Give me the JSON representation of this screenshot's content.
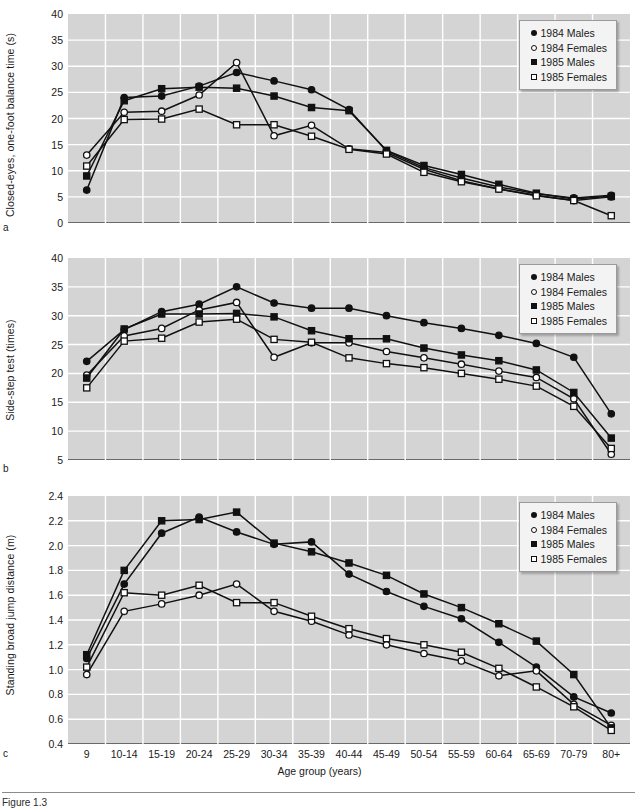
{
  "figure": {
    "caption_partial": "Figure 1.3",
    "x_axis_title": "Age group (years)",
    "categories": [
      "9",
      "10-14",
      "15-19",
      "20-24",
      "25-29",
      "30-34",
      "35-39",
      "40-44",
      "45-49",
      "50-54",
      "55-59",
      "60-64",
      "65-69",
      "70-79",
      "80+"
    ],
    "legend": [
      {
        "label": "1984 Males",
        "marker": "filled-circle"
      },
      {
        "label": "1984 Females",
        "marker": "open-circle"
      },
      {
        "label": "1985 Males",
        "marker": "filled-square"
      },
      {
        "label": "1985 Females",
        "marker": "open-square"
      }
    ],
    "colors": {
      "plot_background": "#d4d4d4",
      "gridline": "#ffffff",
      "series_line": "#111111",
      "axis": "#6a6a6a"
    }
  },
  "panels": [
    {
      "letter": "a",
      "ylabel": "Closed-eyes, one-foot balance time (s)"
    },
    {
      "letter": "b",
      "ylabel": "Side-step test (times)"
    },
    {
      "letter": "c",
      "ylabel": "Standing broad jump distance (m)"
    }
  ],
  "chart_data": [
    {
      "type": "line",
      "panel": "a",
      "title": "",
      "xlabel": "Age group (years)",
      "ylabel": "Closed-eyes, one-foot balance time (s)",
      "categories": [
        "9",
        "10-14",
        "15-19",
        "20-24",
        "25-29",
        "30-34",
        "35-39",
        "40-44",
        "45-49",
        "50-54",
        "55-59",
        "60-64",
        "65-69",
        "70-79",
        "80+"
      ],
      "yticks": [
        0,
        5,
        10,
        15,
        20,
        25,
        30,
        35,
        40
      ],
      "ylim": [
        0,
        40
      ],
      "grid": true,
      "legend_position": "top-right",
      "series": [
        {
          "name": "1984 Males",
          "marker": "filled-circle",
          "values": [
            6.3,
            24.0,
            24.3,
            26.2,
            28.8,
            27.2,
            25.5,
            21.7,
            13.8,
            10.6,
            8.6,
            6.9,
            5.6,
            4.8,
            5.3
          ]
        },
        {
          "name": "1984 Females",
          "marker": "open-circle",
          "values": [
            13.0,
            21.2,
            21.4,
            24.5,
            30.7,
            16.7,
            18.7,
            14.2,
            13.5,
            10.3,
            8.1,
            6.5,
            5.3,
            4.3,
            5.0
          ]
        },
        {
          "name": "1985 Males",
          "marker": "filled-square",
          "values": [
            9.0,
            23.4,
            25.7,
            26.0,
            25.8,
            24.3,
            22.1,
            21.5,
            13.9,
            11.0,
            9.3,
            7.4,
            5.7,
            4.6,
            5.1
          ]
        },
        {
          "name": "1985 Females",
          "marker": "open-square",
          "values": [
            10.9,
            19.8,
            19.9,
            21.8,
            18.8,
            18.8,
            16.6,
            14.1,
            13.2,
            9.7,
            7.9,
            6.5,
            5.2,
            4.3,
            1.4
          ]
        }
      ]
    },
    {
      "type": "line",
      "panel": "b",
      "title": "",
      "xlabel": "Age group (years)",
      "ylabel": "Side-step test (times)",
      "categories": [
        "9",
        "10-14",
        "15-19",
        "20-24",
        "25-29",
        "30-34",
        "35-39",
        "40-44",
        "45-49",
        "50-54",
        "55-59",
        "60-64",
        "65-69",
        "70-79",
        "80+"
      ],
      "yticks": [
        5,
        10,
        15,
        20,
        25,
        30,
        35,
        40
      ],
      "ylim": [
        5,
        40
      ],
      "grid": true,
      "legend_position": "top-right",
      "series": [
        {
          "name": "1984 Males",
          "marker": "filled-circle",
          "values": [
            22.1,
            27.6,
            30.7,
            32.0,
            35.0,
            32.2,
            31.3,
            31.3,
            30.0,
            28.8,
            27.8,
            26.6,
            25.2,
            22.8,
            13.0
          ]
        },
        {
          "name": "1984 Females",
          "marker": "open-circle",
          "values": [
            19.7,
            26.5,
            27.8,
            31.0,
            32.3,
            22.8,
            25.3,
            25.3,
            23.8,
            22.7,
            21.6,
            20.4,
            19.3,
            15.6,
            6.0
          ]
        },
        {
          "name": "1985 Males",
          "marker": "filled-square",
          "values": [
            19.2,
            27.7,
            30.3,
            30.3,
            30.4,
            29.8,
            27.4,
            26.0,
            26.0,
            24.4,
            23.2,
            22.2,
            20.6,
            16.7,
            8.8
          ]
        },
        {
          "name": "1985 Females",
          "marker": "open-square",
          "values": [
            17.5,
            25.6,
            26.1,
            28.9,
            29.4,
            25.9,
            25.4,
            22.7,
            21.7,
            21.0,
            20.0,
            19.0,
            17.8,
            14.3,
            7.0
          ]
        }
      ]
    },
    {
      "type": "line",
      "panel": "c",
      "title": "",
      "xlabel": "Age group (years)",
      "ylabel": "Standing broad jump distance (m)",
      "categories": [
        "9",
        "10-14",
        "15-19",
        "20-24",
        "25-29",
        "30-34",
        "35-39",
        "40-44",
        "45-49",
        "50-54",
        "55-59",
        "60-64",
        "65-69",
        "70-79",
        "80+"
      ],
      "yticks": [
        0.4,
        0.6,
        0.8,
        1.0,
        1.2,
        1.4,
        1.6,
        1.8,
        2.0,
        2.2,
        2.4
      ],
      "ylim": [
        0.4,
        2.4
      ],
      "grid": true,
      "legend_position": "top-right",
      "series": [
        {
          "name": "1984 Males",
          "marker": "filled-circle",
          "values": [
            1.09,
            1.69,
            2.1,
            2.23,
            2.11,
            2.01,
            2.03,
            1.77,
            1.63,
            1.51,
            1.41,
            1.22,
            1.02,
            0.78,
            0.65
          ]
        },
        {
          "name": "1984 Females",
          "marker": "open-circle",
          "values": [
            0.96,
            1.47,
            1.53,
            1.6,
            1.69,
            1.47,
            1.39,
            1.28,
            1.2,
            1.13,
            1.07,
            0.95,
            0.99,
            0.72,
            0.55
          ]
        },
        {
          "name": "1985 Males",
          "marker": "filled-square",
          "values": [
            1.12,
            1.8,
            2.2,
            2.21,
            2.27,
            2.02,
            1.95,
            1.86,
            1.76,
            1.61,
            1.5,
            1.37,
            1.23,
            0.96,
            0.53
          ]
        },
        {
          "name": "1985 Females",
          "marker": "open-square",
          "values": [
            1.02,
            1.62,
            1.6,
            1.68,
            1.54,
            1.54,
            1.43,
            1.33,
            1.25,
            1.2,
            1.14,
            1.01,
            0.86,
            0.7,
            0.51
          ]
        }
      ]
    }
  ]
}
